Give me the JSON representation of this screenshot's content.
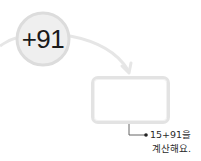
{
  "operation": {
    "label": "+91"
  },
  "answer_box": {
    "value": ""
  },
  "note": {
    "line1": "15+91을",
    "line2": "계산해요."
  },
  "colors": {
    "circle_fill": "#efefef",
    "circle_border": "#dcdcdc",
    "arrow": "#e6e6e6",
    "box_border": "#e3e3e3",
    "leader": "#333333",
    "text": "#1a1a1a"
  }
}
